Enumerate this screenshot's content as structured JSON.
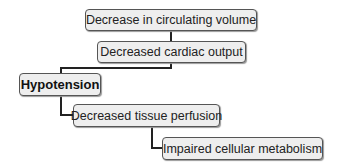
{
  "diagram": {
    "type": "flowchart-cascade",
    "nodes": [
      {
        "id": "n1",
        "label": "Decrease in circulating volume",
        "bold": false
      },
      {
        "id": "n2",
        "label": "Decreased cardiac output",
        "bold": false
      },
      {
        "id": "n3",
        "label": "Hypotension",
        "bold": true
      },
      {
        "id": "n4",
        "label": "Decreased tissue perfusion",
        "bold": false
      },
      {
        "id": "n5",
        "label": "Impaired cellular metabolism",
        "bold": false
      }
    ],
    "edges": [
      {
        "from": "n1",
        "to": "n2"
      },
      {
        "from": "n2",
        "to": "n3"
      },
      {
        "from": "n3",
        "to": "n4"
      },
      {
        "from": "n4",
        "to": "n5"
      }
    ],
    "colors": {
      "box_fill": "#eeeeee",
      "border": "#555555",
      "connector": "#222222"
    }
  }
}
